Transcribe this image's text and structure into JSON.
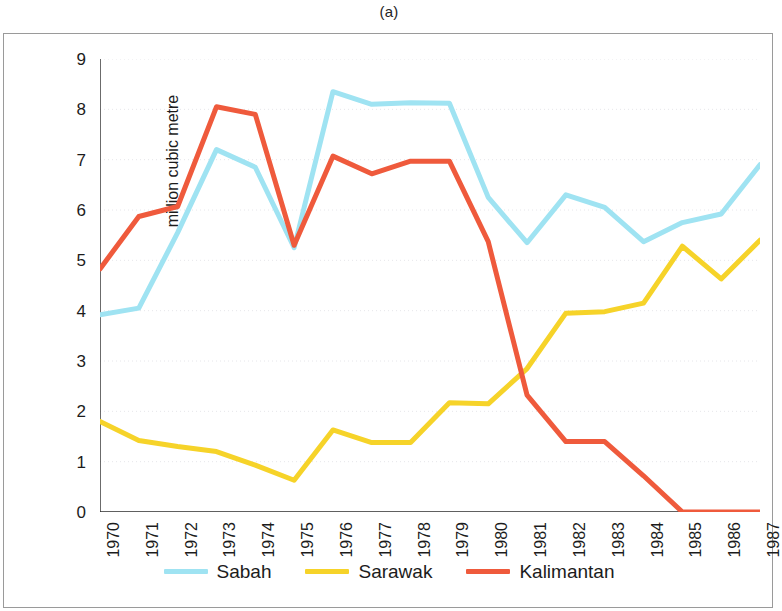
{
  "figure": {
    "caption": "(a)"
  },
  "chart_data": {
    "type": "line",
    "title": "(a)",
    "xlabel": "",
    "ylabel": "million cubic metre",
    "categories": [
      "1970",
      "1971",
      "1972",
      "1973",
      "1974",
      "1975",
      "1976",
      "1977",
      "1978",
      "1979",
      "1980",
      "1981",
      "1982",
      "1983",
      "1984",
      "1985",
      "1986",
      "1987"
    ],
    "x": [
      1970,
      1971,
      1972,
      1973,
      1974,
      1975,
      1976,
      1977,
      1978,
      1979,
      1980,
      1981,
      1982,
      1983,
      1984,
      1985,
      1986,
      1987
    ],
    "ylim": [
      0,
      9
    ],
    "xlim_labels": [
      "1970",
      "1987"
    ],
    "yticks": [
      0,
      1,
      2,
      3,
      4,
      5,
      6,
      7,
      8,
      9
    ],
    "ytick_labels": [
      "0",
      "1",
      "2",
      "3",
      "4",
      "5",
      "6",
      "7",
      "8",
      "9"
    ],
    "grid": true,
    "grid_axis": "y",
    "legend_position": "bottom",
    "series": [
      {
        "name": "Sabah",
        "color": "#9fe3f2",
        "values": [
          3.92,
          4.05,
          5.55,
          7.2,
          6.85,
          5.25,
          8.35,
          8.1,
          8.13,
          8.12,
          6.25,
          5.35,
          6.3,
          6.05,
          5.37,
          5.75,
          5.92,
          6.9
        ]
      },
      {
        "name": "Sarawak",
        "color": "#f6d329",
        "values": [
          1.8,
          1.42,
          1.3,
          1.2,
          0.93,
          0.63,
          1.63,
          1.38,
          1.38,
          2.17,
          2.15,
          2.85,
          3.95,
          3.98,
          4.15,
          5.28,
          4.63,
          5.4
        ]
      },
      {
        "name": "Kalimantan",
        "color": "#ef5a3c",
        "values": [
          4.83,
          5.87,
          6.07,
          8.05,
          7.9,
          5.3,
          7.07,
          6.72,
          6.97,
          6.97,
          5.37,
          2.32,
          1.4,
          1.4,
          0.72,
          0.0,
          0.0,
          0.0
        ]
      }
    ]
  },
  "legend": {
    "items": [
      {
        "label": "Sabah",
        "color": "#9fe3f2"
      },
      {
        "label": "Sarawak",
        "color": "#f6d329"
      },
      {
        "label": "Kalimantan",
        "color": "#ef5a3c"
      }
    ]
  }
}
